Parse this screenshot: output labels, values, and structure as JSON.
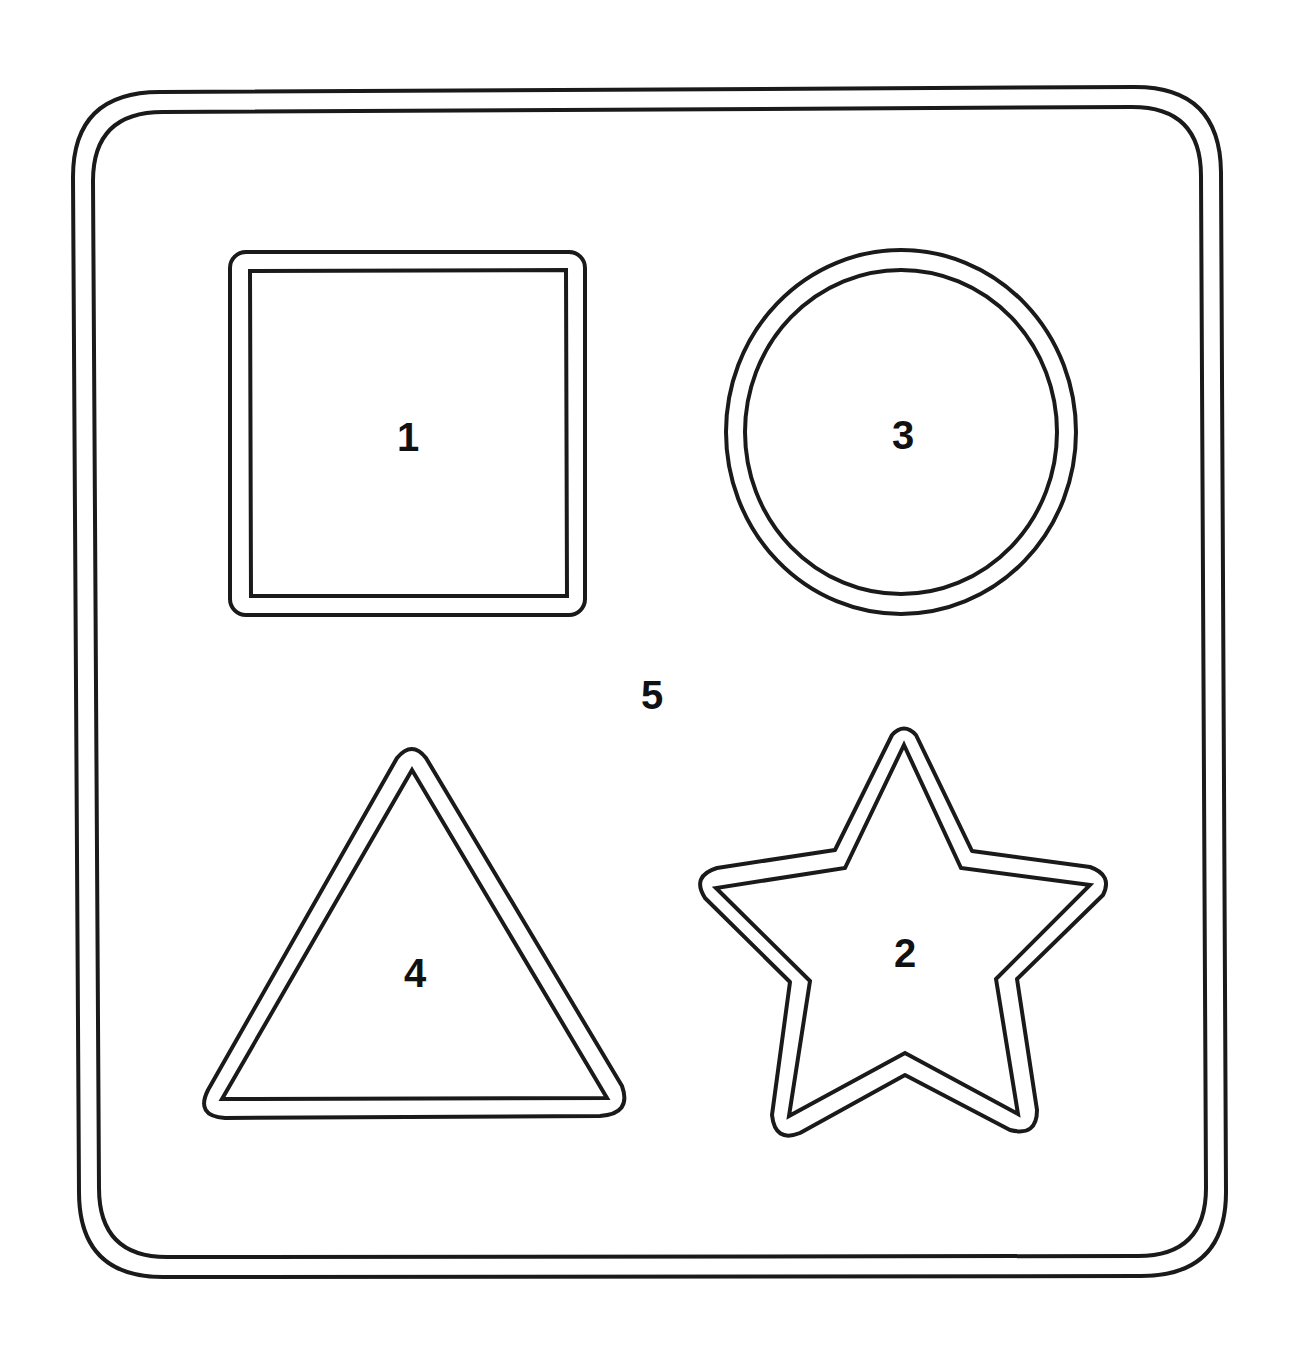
{
  "board": {
    "description": "Shape sorter puzzle board outline with numbered regions",
    "stroke_color": "#1a1a1a",
    "background_color": "#ffffff"
  },
  "regions": {
    "square": {
      "label": "1",
      "shape": "square"
    },
    "star": {
      "label": "2",
      "shape": "star"
    },
    "circle": {
      "label": "3",
      "shape": "circle"
    },
    "triangle": {
      "label": "4",
      "shape": "triangle"
    },
    "board_area": {
      "label": "5",
      "shape": "rounded-rectangle"
    }
  }
}
